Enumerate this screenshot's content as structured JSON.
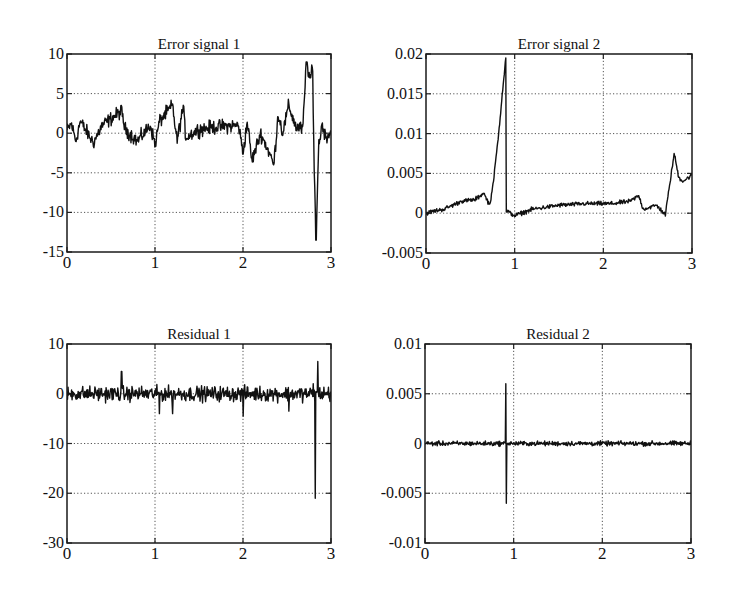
{
  "figure": {
    "background": "#ffffff",
    "line_color": "#111111",
    "grid_color": "#555555"
  },
  "chart_data": [
    {
      "id": "error1",
      "type": "line",
      "title": "Error signal 1",
      "xlabel": "",
      "ylabel": "",
      "xlim": [
        0,
        3
      ],
      "ylim": [
        -15,
        10
      ],
      "xticks": [
        0,
        1,
        2,
        3
      ],
      "yticks": [
        10,
        5,
        0,
        -5,
        -10,
        -15
      ],
      "xtick_labels": [
        "0",
        "1",
        "2",
        "3"
      ],
      "ytick_labels": [
        "10",
        "5",
        "0",
        "-5",
        "-10",
        "-15"
      ],
      "grid": true,
      "box": {
        "left": 67,
        "top": 54,
        "right": 331,
        "bottom": 252
      },
      "description": "Noisy signal around 0 (amplitude ~±2) with a dip to about -4 near t=2.35, a large positive excursion to ~9 near t=2.72-2.78, then a sharp negative spike to ~-13.5 near t=2.82 before returning to ~0.",
      "series": [
        {
          "name": "Error signal 1",
          "noise_amplitude": 1.3,
          "keypoints": [
            [
              0.0,
              0.3
            ],
            [
              0.05,
              1.2
            ],
            [
              0.1,
              -1.0
            ],
            [
              0.15,
              1.5
            ],
            [
              0.3,
              -1.2
            ],
            [
              0.4,
              1.0
            ],
            [
              0.62,
              2.8
            ],
            [
              0.66,
              0.5
            ],
            [
              0.8,
              -1.0
            ],
            [
              0.95,
              1.0
            ],
            [
              1.0,
              -1.5
            ],
            [
              1.05,
              1.5
            ],
            [
              1.2,
              3.5
            ],
            [
              1.25,
              -1.0
            ],
            [
              1.32,
              3.3
            ],
            [
              1.35,
              -0.5
            ],
            [
              1.5,
              0.5
            ],
            [
              1.7,
              0.8
            ],
            [
              1.95,
              1.0
            ],
            [
              2.0,
              -2.5
            ],
            [
              2.05,
              1.5
            ],
            [
              2.1,
              -3.5
            ],
            [
              2.2,
              0.0
            ],
            [
              2.3,
              -2.5
            ],
            [
              2.35,
              -4.0
            ],
            [
              2.4,
              2.5
            ],
            [
              2.45,
              0.0
            ],
            [
              2.52,
              3.5
            ],
            [
              2.6,
              0.8
            ],
            [
              2.68,
              0.5
            ],
            [
              2.72,
              9.0
            ],
            [
              2.76,
              7.0
            ],
            [
              2.79,
              7.8
            ],
            [
              2.81,
              -5.0
            ],
            [
              2.83,
              -13.5
            ],
            [
              2.86,
              -1.5
            ],
            [
              2.9,
              1.2
            ],
            [
              2.94,
              -0.5
            ],
            [
              3.0,
              0.2
            ]
          ]
        }
      ]
    },
    {
      "id": "error2",
      "type": "line",
      "title": "Error signal 2",
      "xlabel": "",
      "ylabel": "",
      "xlim": [
        0,
        3
      ],
      "ylim": [
        -0.005,
        0.02
      ],
      "xticks": [
        0,
        1,
        2,
        3
      ],
      "yticks": [
        0.02,
        0.015,
        0.01,
        0.005,
        0,
        -0.005
      ],
      "xtick_labels": [
        "0",
        "1",
        "2",
        "3"
      ],
      "ytick_labels": [
        "0.02",
        "0.015",
        "0.01",
        "0.005",
        "0",
        "-0.005"
      ],
      "grid": true,
      "box": {
        "left": 426,
        "top": 54,
        "right": 692,
        "bottom": 253
      },
      "description": "Slowly rising noisy drift from 0 to ~0.002 over t=0-0.72, then a linear ramp up to ~0.0195 at t=0.9, immediate drop back to ~0 at t=0.91, slow noisy drift around 0.001 until t≈2.72, then a rise to ~0.0075 at t=2.8 settling near 0.0045-0.005.",
      "series": [
        {
          "name": "Error signal 2",
          "noise_amplitude": 0.0004,
          "keypoints": [
            [
              0.0,
              0.0
            ],
            [
              0.1,
              0.0003
            ],
            [
              0.2,
              0.0005
            ],
            [
              0.4,
              0.0015
            ],
            [
              0.55,
              0.0017
            ],
            [
              0.65,
              0.0025
            ],
            [
              0.72,
              0.001
            ],
            [
              0.76,
              0.004
            ],
            [
              0.82,
              0.01
            ],
            [
              0.86,
              0.015
            ],
            [
              0.9,
              0.0195
            ],
            [
              0.905,
              0.0003
            ],
            [
              0.95,
              0.0
            ],
            [
              1.0,
              -0.0003
            ],
            [
              1.2,
              0.0005
            ],
            [
              1.5,
              0.001
            ],
            [
              1.8,
              0.0012
            ],
            [
              2.1,
              0.0012
            ],
            [
              2.3,
              0.0015
            ],
            [
              2.4,
              0.0022
            ],
            [
              2.45,
              0.0005
            ],
            [
              2.6,
              0.001
            ],
            [
              2.7,
              -0.0002
            ],
            [
              2.74,
              0.003
            ],
            [
              2.8,
              0.0075
            ],
            [
              2.85,
              0.0045
            ],
            [
              2.9,
              0.004
            ],
            [
              3.0,
              0.0048
            ]
          ]
        }
      ]
    },
    {
      "id": "residual1",
      "type": "line",
      "title": "Residual 1",
      "xlabel": "",
      "ylabel": "",
      "xlim": [
        0,
        3
      ],
      "ylim": [
        -30,
        10
      ],
      "xticks": [
        0,
        1,
        2,
        3
      ],
      "yticks": [
        10,
        0,
        -10,
        -20,
        -30
      ],
      "xtick_labels": [
        "0",
        "1",
        "2",
        "3"
      ],
      "ytick_labels": [
        "10",
        "0",
        "-10",
        "-20",
        "-30"
      ],
      "grid": true,
      "box": {
        "left": 67,
        "top": 344,
        "right": 331,
        "bottom": 543
      },
      "description": "Zero-mean white-noise residual (amplitude ~±4) with a single large negative spike to about -21 at t≈2.82 and a positive peak ~6.5 at t≈2.84.",
      "series": [
        {
          "name": "Residual 1",
          "noise_amplitude": 2.2,
          "spikes": [
            [
              0.62,
              4.5
            ],
            [
              1.05,
              4.0
            ],
            [
              1.05,
              -4.0
            ],
            [
              1.2,
              4.0
            ],
            [
              1.2,
              -4.0
            ],
            [
              2.0,
              4.0
            ],
            [
              2.0,
              -4.5
            ],
            [
              2.52,
              6.0
            ],
            [
              2.52,
              -3.5
            ],
            [
              2.8,
              2.0
            ],
            [
              2.82,
              -21.0
            ],
            [
              2.85,
              6.5
            ]
          ]
        }
      ]
    },
    {
      "id": "residual2",
      "type": "line",
      "title": "Residual 2",
      "xlabel": "",
      "ylabel": "",
      "xlim": [
        0,
        3
      ],
      "ylim": [
        -0.01,
        0.01
      ],
      "xticks": [
        0,
        1,
        2,
        3
      ],
      "yticks": [
        0.01,
        0.005,
        0,
        -0.005,
        -0.01
      ],
      "xtick_labels": [
        "0",
        "1",
        "2",
        "3"
      ],
      "ytick_labels": [
        "0.01",
        "0.005",
        "0",
        "-0.005",
        "-0.01"
      ],
      "grid": true,
      "box": {
        "left": 425,
        "top": 344,
        "right": 691,
        "bottom": 543
      },
      "description": "Small zero-mean residual noise (amplitude ~±0.0007) with a single bipolar spike at t≈0.91 reaching +0.006 and -0.006.",
      "series": [
        {
          "name": "Residual 2",
          "noise_amplitude": 0.00035,
          "spikes": [
            [
              0.91,
              0.006
            ],
            [
              0.915,
              -0.006
            ]
          ]
        }
      ]
    }
  ]
}
